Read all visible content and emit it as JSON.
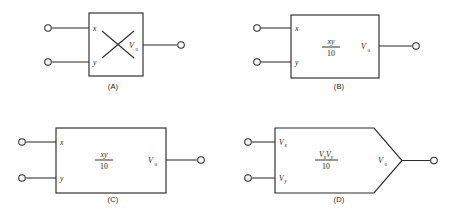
{
  "figure": {
    "ink_color": "#2b2b2b",
    "background_color": "#ffffff"
  },
  "panels": [
    {
      "id": "A",
      "caption": "(A)",
      "shape": "square",
      "symbol": "x-cross",
      "inputs": [
        {
          "label": "x",
          "sub": ""
        },
        {
          "label": "y",
          "sub": ""
        }
      ],
      "output": {
        "label": "V",
        "sub": "o"
      },
      "center_expression": null
    },
    {
      "id": "B",
      "caption": "(B)",
      "shape": "rectangle",
      "symbol": "fraction",
      "inputs": [
        {
          "label": "x",
          "sub": ""
        },
        {
          "label": "y",
          "sub": ""
        }
      ],
      "output": {
        "label": "V",
        "sub": "o"
      },
      "center_expression": {
        "numerator": "xy",
        "denominator": "10"
      }
    },
    {
      "id": "C",
      "caption": "(C)",
      "shape": "rectangle-wide",
      "symbol": "fraction",
      "inputs": [
        {
          "label": "x",
          "sub": ""
        },
        {
          "label": "y",
          "sub": ""
        }
      ],
      "output": {
        "label": "V",
        "sub": "o"
      },
      "center_expression": {
        "numerator": "xy",
        "denominator": "10"
      }
    },
    {
      "id": "D",
      "caption": "(D)",
      "shape": "pentagon",
      "symbol": "fraction",
      "inputs": [
        {
          "label": "V",
          "sub": "x"
        },
        {
          "label": "V",
          "sub": "y"
        }
      ],
      "output": {
        "label": "V",
        "sub": "o"
      },
      "center_expression": {
        "numerator": "V",
        "numerator_sub_1": "x",
        "numerator_2": "V",
        "numerator_sub_2": "y",
        "denominator": "10"
      }
    }
  ]
}
